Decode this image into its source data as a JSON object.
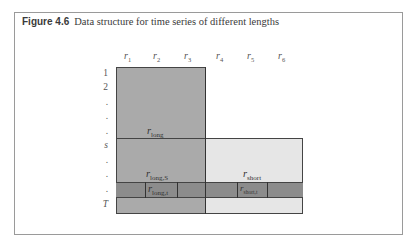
{
  "caption": {
    "number": "Figure 4.6",
    "title": "Data structure for time series of different lengths"
  },
  "columns": [
    {
      "base": "r",
      "sub": "1"
    },
    {
      "base": "r",
      "sub": "2"
    },
    {
      "base": "r",
      "sub": "3"
    },
    {
      "base": "r",
      "sub": "4"
    },
    {
      "base": "r",
      "sub": "5"
    },
    {
      "base": "r",
      "sub": "6"
    }
  ],
  "rows": [
    "1",
    "2",
    ".",
    ".",
    ".",
    "s",
    ".",
    ".",
    ".",
    "T"
  ],
  "regions": {
    "long": {
      "base": "r",
      "sub": "long"
    },
    "long_s": {
      "base": "r",
      "sub": "long,S"
    },
    "short": {
      "base": "r",
      "sub": "short"
    },
    "long_t": {
      "base": "r",
      "sub": "long,t"
    },
    "short_t": {
      "base": "r",
      "sub": "short,t"
    }
  },
  "colors": {
    "long_region": "#aaaaaa",
    "short_region": "#e6e6e6",
    "row_t_band": "#8c8c8c",
    "frame": "#9a9a9a"
  }
}
